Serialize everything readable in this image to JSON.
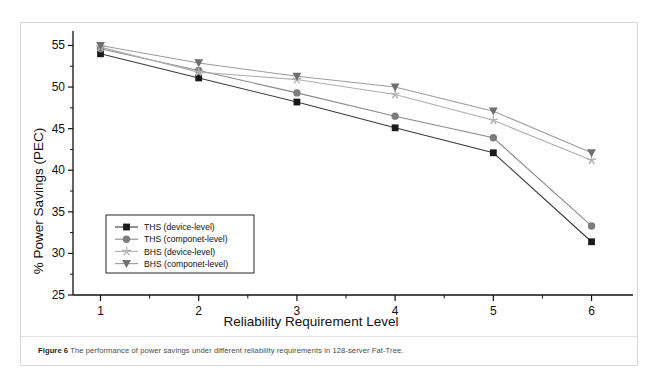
{
  "figure": {
    "caption_label": "Figure 6",
    "caption_text": "The performance of power savings under different reliability requirements in 128-server Fat-Tree."
  },
  "chart_data": {
    "type": "line",
    "title": "",
    "xlabel": "Reliability Requirement Level",
    "ylabel": "% Power Savings (PEC)",
    "x": [
      1,
      2,
      3,
      4,
      5,
      6
    ],
    "xtick_labels": [
      "1",
      "2",
      "3",
      "4",
      "5",
      "6"
    ],
    "ytick_labels": [
      "25",
      "30",
      "35",
      "40",
      "45",
      "50",
      "55"
    ],
    "yticks": [
      25,
      30,
      35,
      40,
      45,
      50,
      55
    ],
    "xlim": [
      0.72,
      6.3
    ],
    "ylim": [
      25,
      56.5
    ],
    "grid": false,
    "legend_position": "lower-left-inside",
    "series": [
      {
        "name": "THS (device-level)",
        "marker": "square",
        "color": "#1a1a1a",
        "line_color": "#3c3c3c",
        "values": [
          54.0,
          51.1,
          48.2,
          45.1,
          42.1,
          31.4
        ]
      },
      {
        "name": "THS (componet-level)",
        "marker": "circle",
        "color": "#7d7d7d",
        "line_color": "#8a8a8a",
        "values": [
          54.6,
          52.0,
          49.3,
          46.5,
          43.9,
          33.3
        ]
      },
      {
        "name": "BHS (device-level)",
        "marker": "star",
        "color": "#b4b4b4",
        "line_color": "#aeaeae",
        "values": [
          54.8,
          51.8,
          50.9,
          49.1,
          46.0,
          41.2
        ]
      },
      {
        "name": "BHS (componet-level)",
        "marker": "triangle-down",
        "color": "#6f6f6f",
        "line_color": "#9c9c9c",
        "values": [
          55.0,
          52.9,
          51.3,
          50.0,
          47.1,
          42.1
        ]
      }
    ]
  }
}
